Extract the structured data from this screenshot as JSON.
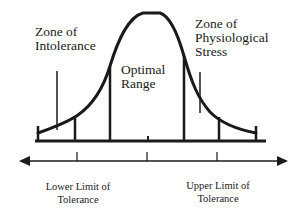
{
  "diagram": {
    "type": "tolerance-curve",
    "zones": {
      "intolerance": "Zone of\nIntolerance",
      "optimal": "Optimal\nRange",
      "stress": "Zone of\nPhysiological\nStress"
    },
    "limits": {
      "lower": "Lower Limit of\nTolerance",
      "upper": "Upper Limit of\nTolerance"
    },
    "colors": {
      "stroke": "#1a1a1a",
      "background": "#ffffff"
    }
  }
}
